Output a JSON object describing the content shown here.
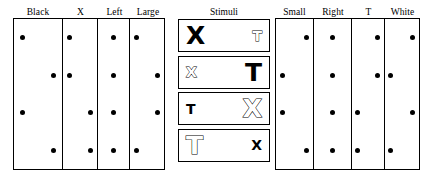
{
  "figure": {
    "type": "stimulus-feature-dot-matrix",
    "left_panel": {
      "name": "left-dot-matrix",
      "columns": [
        {
          "header": "Black",
          "dots": [
            "left",
            "right",
            "left",
            "right"
          ]
        },
        {
          "header": "X",
          "dots": [
            "left",
            "left",
            "right",
            "right"
          ]
        },
        {
          "header": "Left",
          "dots": [
            "mid",
            "mid",
            "mid",
            "mid"
          ]
        },
        {
          "header": "Large",
          "dots": [
            "left",
            "right",
            "right",
            "left"
          ]
        }
      ]
    },
    "stimuli_panel": {
      "name": "stimuli-column",
      "title": "Stimuli",
      "rows": [
        {
          "left": {
            "letter": "X",
            "size": "big",
            "color": "black"
          },
          "right": {
            "letter": "T",
            "size": "small",
            "color": "white"
          }
        },
        {
          "left": {
            "letter": "X",
            "size": "small",
            "color": "white"
          },
          "right": {
            "letter": "T",
            "size": "big",
            "color": "black"
          }
        },
        {
          "left": {
            "letter": "T",
            "size": "small",
            "color": "black"
          },
          "right": {
            "letter": "X",
            "size": "big",
            "color": "white"
          }
        },
        {
          "left": {
            "letter": "T",
            "size": "big",
            "color": "white"
          },
          "right": {
            "letter": "X",
            "size": "small",
            "color": "black"
          }
        }
      ]
    },
    "right_panel": {
      "name": "right-dot-matrix",
      "columns": [
        {
          "header": "Small",
          "dots": [
            "right",
            "left",
            "left",
            "right"
          ]
        },
        {
          "header": "Right",
          "dots": [
            "mid",
            "mid",
            "mid",
            "mid"
          ]
        },
        {
          "header": "T",
          "dots": [
            "right",
            "right",
            "left",
            "left"
          ]
        },
        {
          "header": "White",
          "dots": [
            "right",
            "left",
            "right",
            "left"
          ]
        }
      ]
    },
    "colors": {
      "ink": "#000000",
      "background": "#ffffff"
    }
  }
}
